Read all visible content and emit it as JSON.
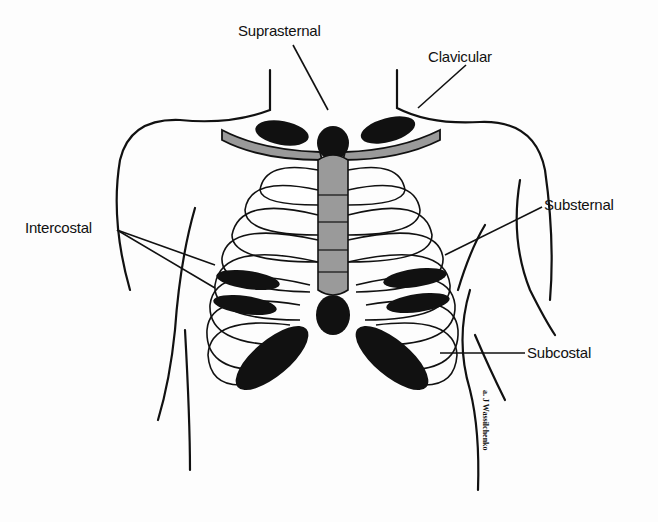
{
  "diagram": {
    "labels": {
      "suprasternal": "Suprasternal",
      "clavicular": "Clavicular",
      "intercostal": "Intercostal",
      "substernal": "Substernal",
      "subcostal": "Subcostal"
    },
    "signature": "a. J Wassilchenko",
    "colors": {
      "bone": "#9a9a9a",
      "retraction": "#111111",
      "outline": "#111111",
      "background": "#fdfdfd"
    }
  }
}
